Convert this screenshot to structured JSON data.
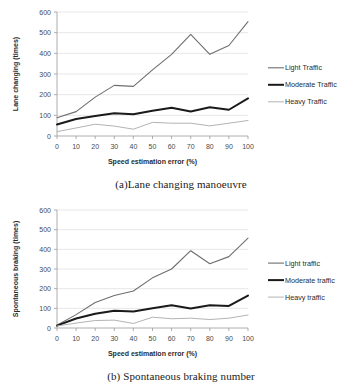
{
  "figure_a": {
    "caption": "(a)Lane changing manoeuvre",
    "chart_data": {
      "type": "line",
      "title": "",
      "xlabel": "Speed estimation error (%)",
      "ylabel": "Lane changing (times)",
      "x": [
        0,
        10,
        20,
        30,
        40,
        50,
        60,
        70,
        80,
        90,
        100
      ],
      "xticks": [
        "0",
        "10",
        "20",
        "30",
        "40",
        "50",
        "60",
        "70",
        "80",
        "90",
        "100"
      ],
      "yticks": [
        "0",
        "100",
        "200",
        "300",
        "400",
        "500",
        "600"
      ],
      "xlim": [
        0,
        100
      ],
      "ylim": [
        0,
        600
      ],
      "grid": true,
      "legend_position": "right",
      "series": [
        {
          "name": "Light Traffic",
          "color": "#6e6e6e",
          "width": 1.1,
          "values": [
            88,
            118,
            188,
            245,
            240,
            320,
            395,
            492,
            395,
            438,
            553
          ]
        },
        {
          "name": "Moderate Traffic",
          "color": "#1a1a1a",
          "width": 2.0,
          "values": [
            56,
            82,
            97,
            110,
            105,
            122,
            137,
            119,
            139,
            127,
            182
          ]
        },
        {
          "name": "Heavy Traffic",
          "color": "#b3b3b3",
          "width": 1.0,
          "values": [
            21,
            39,
            57,
            48,
            33,
            66,
            62,
            62,
            49,
            62,
            75
          ]
        }
      ]
    }
  },
  "figure_b": {
    "caption": "(b) Spontaneous braking number",
    "chart_data": {
      "type": "line",
      "title": "",
      "xlabel": "Speed estimation error (%)",
      "ylabel": "Spontaneous braking (times)",
      "x": [
        0,
        10,
        20,
        30,
        40,
        50,
        60,
        70,
        80,
        90,
        100
      ],
      "xticks": [
        "0",
        "10",
        "20",
        "30",
        "40",
        "50",
        "60",
        "70",
        "80",
        "90",
        "100"
      ],
      "yticks": [
        "0",
        "100",
        "200",
        "300",
        "400",
        "500",
        "600"
      ],
      "xlim": [
        0,
        100
      ],
      "ylim": [
        0,
        600
      ],
      "grid": true,
      "legend_position": "right",
      "series": [
        {
          "name": "Light traffic",
          "color": "#6e6e6e",
          "width": 1.1,
          "values": [
            14,
            68,
            130,
            165,
            188,
            255,
            300,
            393,
            327,
            363,
            457
          ]
        },
        {
          "name": "Moderate traffic",
          "color": "#1a1a1a",
          "width": 2.0,
          "values": [
            12,
            48,
            72,
            88,
            84,
            100,
            116,
            99,
            116,
            112,
            165
          ]
        },
        {
          "name": "Heavy traffic",
          "color": "#b3b3b3",
          "width": 1.0,
          "values": [
            10,
            25,
            38,
            40,
            23,
            55,
            47,
            50,
            43,
            50,
            66
          ]
        }
      ]
    }
  }
}
